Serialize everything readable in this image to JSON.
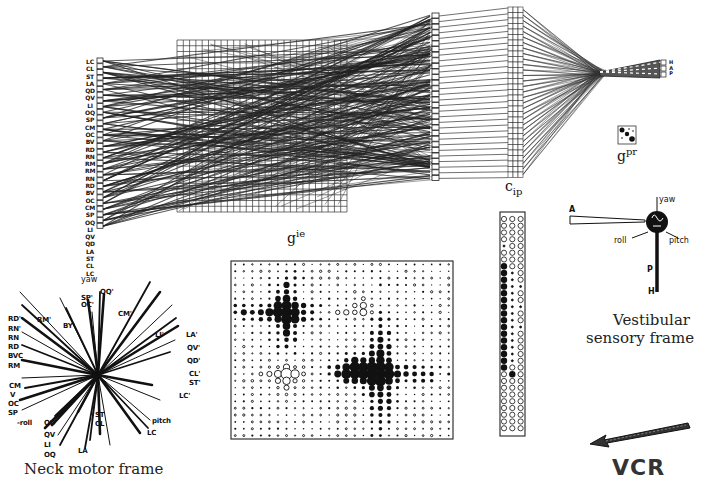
{
  "figure": {
    "domain": "neural network transformation diagram",
    "layers": {
      "input_column": {
        "name": "Vestibular input units",
        "labels": [
          "LC",
          "CL",
          "ST",
          "LA",
          "QD",
          "QV",
          "LI",
          "OQ",
          "SP",
          "CM",
          "OC",
          "BV",
          "RD",
          "RN",
          "RM",
          "RM",
          "RN",
          "RD",
          "BV",
          "OC",
          "CM",
          "SP",
          "OQ",
          "LI",
          "QV",
          "QD",
          "LA",
          "ST",
          "CL",
          "LC"
        ]
      },
      "gie": {
        "label_base": "g",
        "label_sup": "ie",
        "grid_cols": 27,
        "grid_rows": 30
      },
      "cip": {
        "label_base": "c",
        "label_sub": "ip",
        "units": 30
      },
      "gpr": {
        "label_base": "g",
        "label_sup": "pr"
      },
      "output": {
        "labels": [
          "H",
          "A",
          "P"
        ]
      }
    },
    "vestibular_frame": {
      "title_line1": "Vestibular",
      "title_line2": "sensory frame",
      "axes": {
        "A": "A",
        "P": "P",
        "H": "H"
      },
      "rotations": {
        "yaw": "yaw",
        "roll": "roll",
        "pitch": "pitch"
      }
    },
    "neck_frame": {
      "title": "Neck motor frame",
      "top_label": "yaw",
      "left_labels": [
        "RD'",
        "RN'",
        "RN",
        "RD",
        "BVC",
        "RM",
        "CM",
        "V",
        "OC",
        "SP",
        "-roll",
        "QD",
        "QV",
        "LI",
        "OQ"
      ],
      "top_labels": [
        "RM'",
        "BY'",
        "SP'",
        "OC'",
        "OQ'",
        "CM'"
      ],
      "right_labels": [
        "LI'",
        "LA'",
        "QV'",
        "QD'",
        "CL'",
        "ST'",
        "LC'",
        "pitch",
        "LC"
      ],
      "bottom_labels": [
        "ST",
        "CL",
        "LA"
      ]
    },
    "weight_matrix": {
      "rows": 26,
      "cols": 26,
      "title": "Hinton diagram"
    },
    "strip_matrix": {
      "rows": 32,
      "cols": 3
    },
    "vcr": {
      "label": "VCR",
      "arrow": "left-arrow"
    }
  }
}
